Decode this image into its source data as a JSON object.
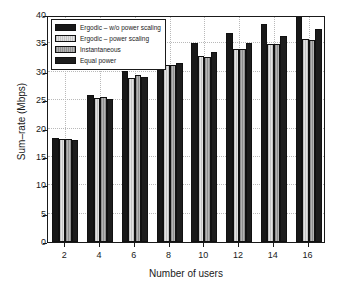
{
  "chart_data": {
    "type": "bar",
    "title": "",
    "xlabel": "Number of users",
    "ylabel": "Sum–rate (Mbps)",
    "categories": [
      "2",
      "4",
      "6",
      "8",
      "10",
      "12",
      "14",
      "16"
    ],
    "xlim": [
      1,
      17
    ],
    "ylim": [
      0,
      40
    ],
    "yticks": [
      0,
      5,
      10,
      15,
      20,
      25,
      30,
      35,
      40
    ],
    "ytick_labels": [
      "0",
      "5",
      "10",
      "15",
      "20",
      "25",
      "30",
      "35",
      "40"
    ],
    "xticks": [
      2,
      4,
      6,
      8,
      10,
      12,
      14,
      16
    ],
    "xtick_labels": [
      "2",
      "4",
      "6",
      "8",
      "10",
      "12",
      "14",
      "16"
    ],
    "grid": true,
    "grid_style": "dotted",
    "legend_position": "upper left",
    "series": [
      {
        "name": "Ergodic – w/o power scaling",
        "color": "#181818",
        "values": [
          18.3,
          25.9,
          30.1,
          33.0,
          35.1,
          36.9,
          38.4,
          40.0
        ]
      },
      {
        "name": "Ergodic – power scaling",
        "color": "#cfcfcf",
        "values": [
          18.1,
          25.3,
          28.9,
          31.2,
          32.8,
          34.0,
          34.9,
          35.7
        ]
      },
      {
        "name": "Instantaneous",
        "color": "#a2a2a2",
        "values": [
          18.1,
          25.5,
          29.4,
          31.2,
          32.6,
          34.0,
          34.9,
          35.6
        ]
      },
      {
        "name": "Equal power",
        "color": "#1d1d1d",
        "values": [
          18.0,
          25.2,
          29.0,
          31.6,
          33.4,
          35.0,
          36.3,
          37.5
        ]
      }
    ]
  },
  "legend": {
    "entries": [
      "Ergodic – w/o power scaling",
      "Ergodic – power scaling",
      "Instantaneous",
      "Equal power"
    ]
  },
  "colors": {
    "axis": "#1a1a1a",
    "grid": "#b9b9b9",
    "background": "#ffffff"
  }
}
